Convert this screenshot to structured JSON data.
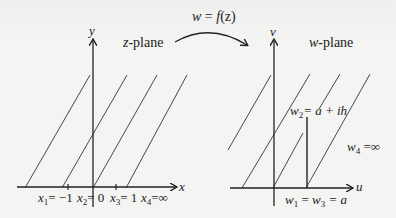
{
  "mapping": {
    "label_w": "w",
    "label_eq": " = ",
    "label_f": "f",
    "label_z": "(z)"
  },
  "z_plane": {
    "title_var": "z",
    "title_text": "-plane",
    "x_axis_label": "x",
    "y_axis_label": "y",
    "points": [
      {
        "var": "x",
        "sub": "1",
        "value": "= −1"
      },
      {
        "var": "x",
        "sub": "2",
        "value": "= 0"
      },
      {
        "var": "x",
        "sub": "3",
        "value": "= 1"
      },
      {
        "var": "x",
        "sub": "4",
        "value": "=∞"
      }
    ]
  },
  "w_plane": {
    "title_var": "w",
    "title_text": "-plane",
    "u_axis_label": "u",
    "v_axis_label": "v",
    "w2": {
      "var": "w",
      "sub": "2",
      "value": "= a + ih"
    },
    "w4": {
      "var": "w",
      "sub": "4",
      "value": " =∞"
    },
    "w13": {
      "var1": "w",
      "sub1": "1",
      "eq1": " = ",
      "var2": "w",
      "sub2": "3",
      "value": " = a"
    }
  },
  "colors": {
    "ink": "#222222",
    "background": "#f4f4f2"
  }
}
